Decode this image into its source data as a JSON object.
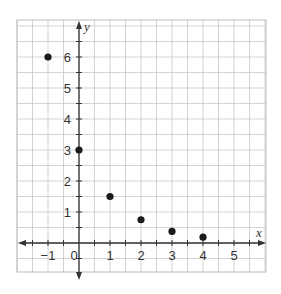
{
  "chart_data": {
    "type": "scatter",
    "title": "",
    "xlabel": "x",
    "ylabel": "y",
    "xlim": [
      -2,
      6
    ],
    "ylim": [
      -1,
      7.2
    ],
    "grid": true,
    "grid_step": 0.5,
    "legend": null,
    "x_tick_labels": [
      "−1",
      "0",
      "1",
      "2",
      "3",
      "4",
      "5"
    ],
    "x_ticks": [
      -1,
      0,
      1,
      2,
      3,
      4,
      5
    ],
    "y_tick_labels": [
      "1",
      "2",
      "3",
      "4",
      "5",
      "6"
    ],
    "y_ticks": [
      1,
      2,
      3,
      4,
      5,
      6
    ],
    "series": [
      {
        "name": "points",
        "x": [
          -1,
          0,
          1,
          2,
          3,
          4
        ],
        "y": [
          6,
          3,
          1.5,
          0.75,
          0.375,
          0.1875
        ]
      }
    ]
  },
  "colors": {
    "grid": "#c8c8c8",
    "axis": "#333333",
    "point": "#1a1a1a",
    "frame": "#bdbdbd"
  }
}
